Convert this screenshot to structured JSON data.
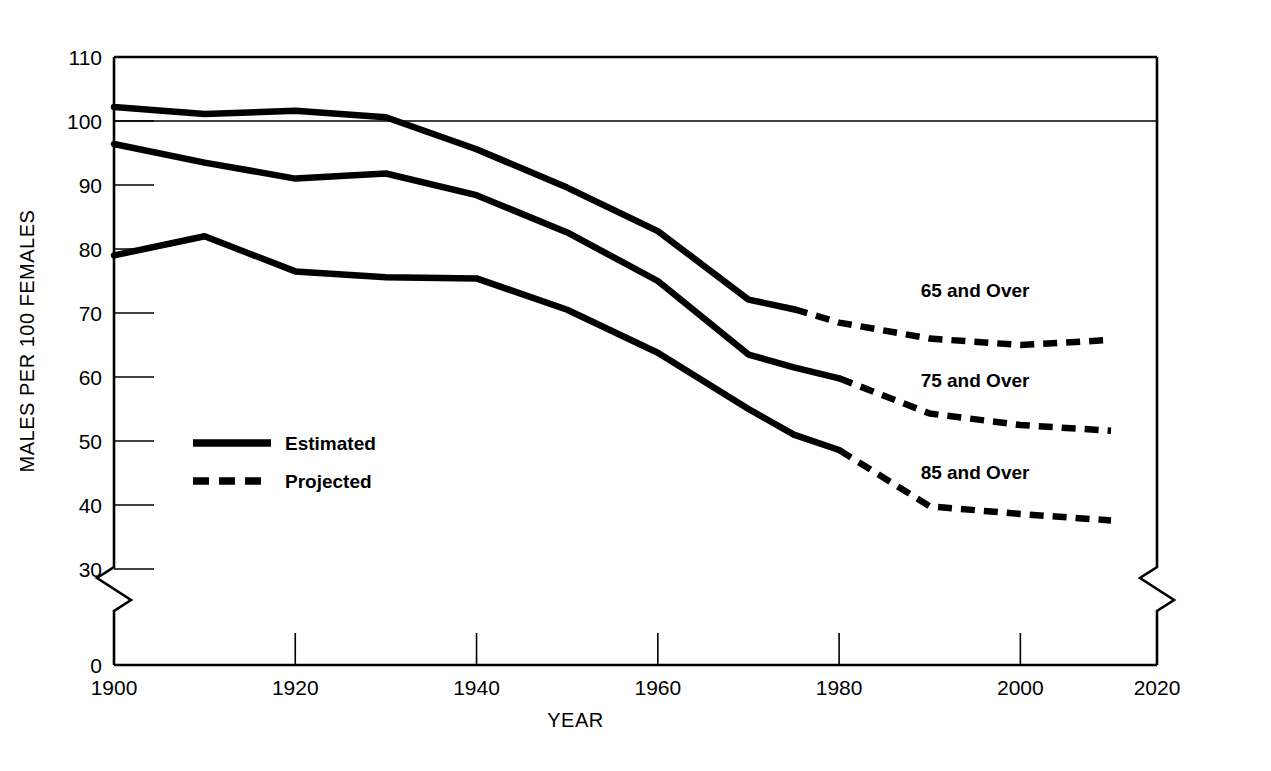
{
  "figure": {
    "bleed_through_text": "",
    "background_color": "#ffffff",
    "line_color": "#000000"
  },
  "chart_data": {
    "type": "line",
    "title": "",
    "xlabel": "YEAR",
    "ylabel": "MALES PER 100 FEMALES",
    "xlim": [
      1900,
      2020
    ],
    "ylim": [
      0,
      110
    ],
    "y_axis_break": true,
    "y_break_between": [
      0,
      30
    ],
    "x_axis_break": true,
    "x_break_between": [
      2010,
      2020
    ],
    "grid": false,
    "reference_line": 100,
    "xticks": [
      1900,
      1920,
      1940,
      1960,
      1980,
      2000,
      2020
    ],
    "xtick_labels": [
      "1900",
      "1920",
      "1940",
      "1960",
      "1980",
      "2000",
      "2020"
    ],
    "yticks": [
      0,
      30,
      40,
      50,
      60,
      70,
      80,
      90,
      100,
      110
    ],
    "ytick_labels": [
      "0",
      "30",
      "40",
      "50",
      "60",
      "70",
      "80",
      "90",
      "100",
      "110"
    ],
    "legend": {
      "position": "inside-left",
      "entries": [
        {
          "label": "Estimated",
          "style": "solid"
        },
        {
          "label": "Projected",
          "style": "dashed"
        }
      ]
    },
    "x": [
      1900,
      1910,
      1920,
      1930,
      1940,
      1950,
      1960,
      1970,
      1975,
      1980,
      1990,
      2000,
      2010
    ],
    "series": [
      {
        "name": "65 and Over",
        "label": "65 and Over",
        "label_x": 1995,
        "label_y": 72.5,
        "estimated_until": 1975,
        "values": [
          102.2,
          101.1,
          101.6,
          100.6,
          95.6,
          89.6,
          82.8,
          72.1,
          70.6,
          68.5,
          66.0,
          65.0,
          65.8
        ]
      },
      {
        "name": "75 and Over",
        "label": "75 and Over",
        "label_x": 1995,
        "label_y": 58.5,
        "estimated_until": 1980,
        "values": [
          96.4,
          93.5,
          91.0,
          91.8,
          88.4,
          82.6,
          75.0,
          63.5,
          61.5,
          59.8,
          54.3,
          52.5,
          51.6
        ]
      },
      {
        "name": "85 and Over",
        "label": "85 and Over",
        "label_x": 1995,
        "label_y": 44.0,
        "estimated_until": 1980,
        "values": [
          79.0,
          82.0,
          76.5,
          75.6,
          75.4,
          70.5,
          63.8,
          55.0,
          51.0,
          48.6,
          39.8,
          38.6,
          37.6
        ]
      }
    ]
  }
}
